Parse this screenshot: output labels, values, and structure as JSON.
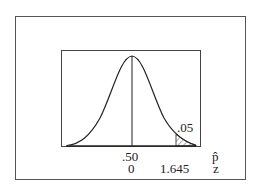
{
  "diagram": {
    "type": "normal-distribution-right-tail",
    "tail_area_label": ".05",
    "axis_labels": {
      "phat_center": ".50",
      "z_center": "0",
      "z_critical": "1.645",
      "phat_symbol": "p̂",
      "z_symbol": "z"
    },
    "colors": {
      "line": "#222222",
      "frame": "#555555",
      "background": "#ffffff"
    }
  }
}
